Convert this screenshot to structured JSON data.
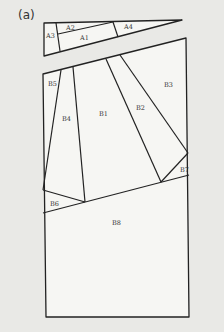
{
  "figure": {
    "panel_label": "(a)",
    "pieces": {
      "A1": "A1",
      "A2": "A2",
      "A3": "A3",
      "A4": "A4",
      "B1": "B1",
      "B2": "B2",
      "B3": "B3",
      "B4": "B4",
      "B5": "B5",
      "B6": "B6",
      "B7": "B7",
      "B8": "B8"
    },
    "colors": {
      "background": "#e9e9e6",
      "piece_fill": "#f6f6f3",
      "line": "#222222"
    }
  }
}
